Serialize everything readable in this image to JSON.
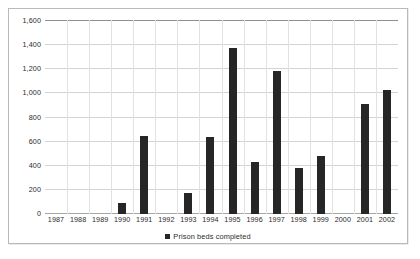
{
  "chart_data": {
    "type": "bar",
    "title": "",
    "xlabel": "",
    "ylabel": "",
    "grid": true,
    "legend_position": "bottom",
    "ylim": [
      0,
      1600
    ],
    "ytick_labels": [
      "1,600",
      "1,400",
      "1,200",
      "1,000",
      "800",
      "600",
      "400",
      "200",
      "0"
    ],
    "ytick_values": [
      1600,
      1400,
      1200,
      1000,
      800,
      600,
      400,
      200,
      0
    ],
    "categories": [
      "1987",
      "1988",
      "1989",
      "1990",
      "1991",
      "1992",
      "1993",
      "1994",
      "1995",
      "1996",
      "1997",
      "1998",
      "1999",
      "2000",
      "2001",
      "2002"
    ],
    "series": [
      {
        "name": "Prison beds completed",
        "color": "#262626",
        "values": [
          0,
          0,
          0,
          95,
          645,
          0,
          175,
          640,
          1375,
          435,
          1185,
          380,
          480,
          0,
          910,
          1025
        ]
      }
    ],
    "legend": [
      {
        "label": "Prison beds completed",
        "marker": "square",
        "color": "#262626"
      }
    ]
  }
}
